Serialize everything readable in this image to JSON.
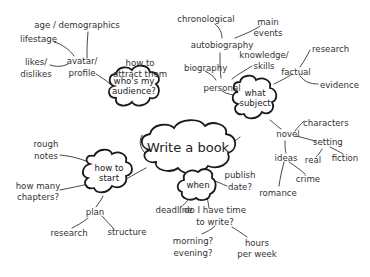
{
  "title": "Write a book",
  "colors": {
    "ink": "#1a1a1a",
    "text": "#333333",
    "background": "#ffffff"
  },
  "branches": {
    "audience": {
      "label_lines": [
        "who's my",
        "audience?"
      ],
      "children": {
        "attract": [
          "how to",
          "attract them"
        ],
        "avatar": [
          "avatar/",
          "profile"
        ],
        "age": [
          "age / demographics"
        ],
        "lifestage": [
          "lifestage"
        ],
        "likes": [
          "likes/",
          "dislikes"
        ]
      }
    },
    "subject": {
      "label_lines": [
        "what",
        "subject"
      ],
      "children": {
        "personal": [
          "personal"
        ],
        "biography": [
          "biography"
        ],
        "autobiography": [
          "autobiography"
        ],
        "chronological": [
          "chronological"
        ],
        "main_events": [
          "main",
          "events"
        ],
        "knowledge": [
          "knowledge/",
          "skills"
        ],
        "factual": [
          "factual"
        ],
        "research": [
          "research"
        ],
        "evidence": [
          "evidence"
        ],
        "novel": [
          "novel"
        ],
        "characters": [
          "characters"
        ],
        "setting": [
          "setting"
        ],
        "real": [
          "real"
        ],
        "fiction": [
          "fiction"
        ],
        "ideas": [
          "ideas"
        ],
        "crime": [
          "crime"
        ],
        "romance": [
          "romance"
        ]
      }
    },
    "start": {
      "label_lines": [
        "how to",
        "start"
      ],
      "children": {
        "rough_notes": [
          "rough",
          "notes"
        ],
        "chapters": [
          "how many",
          "chapters?"
        ],
        "plan": [
          "plan"
        ],
        "research": [
          "research"
        ],
        "structure": [
          "structure"
        ]
      }
    },
    "when": {
      "label_lines": [
        "when"
      ],
      "children": {
        "publish": [
          "publish",
          "date?"
        ],
        "deadline": [
          "deadline"
        ],
        "time": [
          "do I have time",
          "to write?"
        ],
        "morning": [
          "morning?",
          "evening?"
        ],
        "hours": [
          "hours",
          "per week"
        ]
      }
    }
  }
}
